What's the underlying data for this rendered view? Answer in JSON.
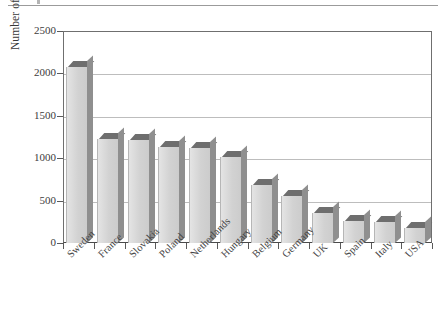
{
  "figure": {
    "has_top_rule": true,
    "background_color": "#ffffff"
  },
  "chart_data": {
    "type": "bar",
    "title": "",
    "xlabel": "",
    "ylabel": "Number of people per lawyer",
    "ylim": [
      0,
      2500
    ],
    "yticks": [
      0,
      500,
      1000,
      1500,
      2000,
      2500
    ],
    "ytick_labels": [
      "0",
      "500",
      "1000",
      "1500",
      "2000",
      "2500"
    ],
    "grid": true,
    "legend": false,
    "bar_style": "3d-shaded",
    "bar_face_color": "#d9d9d9",
    "bar_top_color": "#6e6e6e",
    "bar_side_color": "#8f8f8f",
    "categories": [
      "Sweden",
      "France",
      "Slovakia",
      "Poland",
      "Netherlands",
      "Hungary",
      "Belgium",
      "Germany",
      "UK",
      "Spain",
      "Italy",
      "USA"
    ],
    "values": [
      2080,
      1230,
      1220,
      1130,
      1120,
      1010,
      680,
      560,
      350,
      260,
      250,
      180
    ]
  }
}
